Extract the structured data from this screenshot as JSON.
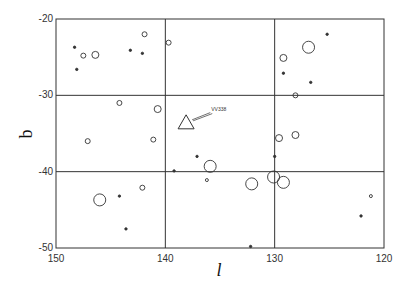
{
  "chart_data": {
    "type": "scatter",
    "title": "",
    "xlabel": "l",
    "ylabel": "b",
    "xlim": [
      150,
      120
    ],
    "ylim": [
      -50,
      -20
    ],
    "x_reversed": true,
    "xticks": [
      150,
      140,
      130,
      120
    ],
    "yticks": [
      -20,
      -30,
      -40,
      -50
    ],
    "grid": true,
    "grid_lines": {
      "x": [
        140,
        130
      ],
      "y": [
        -30,
        -40
      ]
    },
    "legend": null,
    "annotations": [
      {
        "text": "VV338",
        "target": {
          "l": 138.1,
          "b": -33.6
        },
        "label_pos": {
          "l": 135.8,
          "b": -32.0
        },
        "arrow": true
      }
    ],
    "series": [
      {
        "name": "VV338",
        "marker": "triangle",
        "points": [
          {
            "l": 138.1,
            "b": -33.6,
            "size": 8
          }
        ]
      },
      {
        "name": "objects",
        "marker": "circle-size-coded",
        "points": [
          {
            "l": 148.3,
            "b": -23.7,
            "size": 1.2,
            "filled": true
          },
          {
            "l": 147.5,
            "b": -24.8,
            "size": 2.5,
            "filled": false
          },
          {
            "l": 146.4,
            "b": -24.7,
            "size": 3.5,
            "filled": false
          },
          {
            "l": 148.1,
            "b": -26.6,
            "size": 1.2,
            "filled": true
          },
          {
            "l": 143.2,
            "b": -24.1,
            "size": 1.2,
            "filled": true
          },
          {
            "l": 142.1,
            "b": -24.5,
            "size": 1.2,
            "filled": true
          },
          {
            "l": 141.9,
            "b": -22.0,
            "size": 2.5,
            "filled": false
          },
          {
            "l": 139.7,
            "b": -23.1,
            "size": 2.5,
            "filled": false
          },
          {
            "l": 125.2,
            "b": -22.0,
            "size": 1.2,
            "filled": true
          },
          {
            "l": 126.9,
            "b": -23.7,
            "size": 6,
            "filled": false
          },
          {
            "l": 129.2,
            "b": -25.1,
            "size": 3.5,
            "filled": false
          },
          {
            "l": 129.2,
            "b": -27.1,
            "size": 1.2,
            "filled": true
          },
          {
            "l": 126.7,
            "b": -28.3,
            "size": 1.2,
            "filled": true
          },
          {
            "l": 128.1,
            "b": -30.0,
            "size": 2.5,
            "filled": false
          },
          {
            "l": 144.2,
            "b": -31.0,
            "size": 2.5,
            "filled": false
          },
          {
            "l": 140.7,
            "b": -31.8,
            "size": 3.5,
            "filled": false
          },
          {
            "l": 147.1,
            "b": -36.0,
            "size": 2.5,
            "filled": false
          },
          {
            "l": 141.1,
            "b": -35.8,
            "size": 2.5,
            "filled": false
          },
          {
            "l": 137.1,
            "b": -38.0,
            "size": 1.2,
            "filled": true
          },
          {
            "l": 135.9,
            "b": -39.3,
            "size": 6,
            "filled": false
          },
          {
            "l": 139.2,
            "b": -39.9,
            "size": 1.2,
            "filled": true
          },
          {
            "l": 129.6,
            "b": -35.6,
            "size": 3.5,
            "filled": false
          },
          {
            "l": 128.1,
            "b": -35.2,
            "size": 3.5,
            "filled": false
          },
          {
            "l": 130.0,
            "b": -38.0,
            "size": 1.2,
            "filled": true
          },
          {
            "l": 146.0,
            "b": -43.7,
            "size": 6,
            "filled": false
          },
          {
            "l": 144.2,
            "b": -43.2,
            "size": 1.2,
            "filled": true
          },
          {
            "l": 142.1,
            "b": -42.1,
            "size": 2.5,
            "filled": false
          },
          {
            "l": 143.6,
            "b": -47.5,
            "size": 1.2,
            "filled": true
          },
          {
            "l": 136.2,
            "b": -41.1,
            "size": 1.5,
            "filled": false
          },
          {
            "l": 132.1,
            "b": -41.6,
            "size": 6,
            "filled": false
          },
          {
            "l": 132.2,
            "b": -49.8,
            "size": 1.2,
            "filled": true
          },
          {
            "l": 130.1,
            "b": -40.7,
            "size": 6,
            "filled": false
          },
          {
            "l": 129.2,
            "b": -41.4,
            "size": 6,
            "filled": false
          },
          {
            "l": 121.2,
            "b": -43.2,
            "size": 1.5,
            "filled": false
          },
          {
            "l": 122.1,
            "b": -45.8,
            "size": 1.2,
            "filled": true
          }
        ]
      }
    ]
  },
  "colors": {
    "axis": "#333333",
    "marker": "#333333",
    "background": "#ffffff"
  }
}
